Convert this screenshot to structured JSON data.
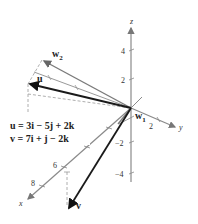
{
  "figure": {
    "type": "3d-vector-projection",
    "axes": {
      "x": {
        "label": "x",
        "ticks": [
          "6",
          "8"
        ]
      },
      "y": {
        "label": "y",
        "ticks": [
          "2"
        ]
      },
      "z": {
        "label": "z",
        "ticks": [
          "4",
          "2",
          "−2",
          "−4"
        ]
      }
    },
    "vectors": {
      "u": {
        "label": "u"
      },
      "v": {
        "label": "v"
      },
      "w1": {
        "label": "w",
        "sub": "1"
      },
      "w2": {
        "label": "w",
        "sub": "2"
      }
    },
    "equations": [
      "u = 3i − 5j + 2k",
      "v = 7i + j − 2k"
    ],
    "colors": {
      "axis": "#8a8a8a",
      "thick_vector": "#1a1a1a",
      "gray_vector": "#7a7a7a",
      "dashed": "#9a9a9a"
    }
  }
}
